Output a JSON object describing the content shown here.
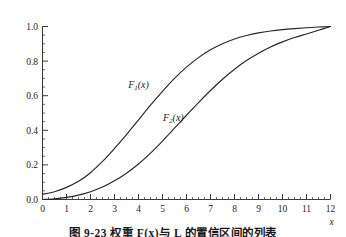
{
  "chart_data": {
    "type": "line",
    "title": "",
    "xlabel": "x",
    "ylabel": "",
    "xlim": [
      0,
      12
    ],
    "ylim": [
      0,
      1.0
    ],
    "grid": false,
    "legend_position": "inline-annotation",
    "x_ticks": [
      0,
      1,
      2,
      3,
      4,
      5,
      6,
      7,
      8,
      9,
      10,
      11,
      12
    ],
    "x_tick_labels": [
      "0",
      "1",
      "2",
      "3",
      "4",
      "5",
      "6",
      "7",
      "8",
      "9",
      "10",
      "11",
      "12"
    ],
    "x_minor_step": 0.25,
    "y_ticks": [
      0.0,
      0.2,
      0.4,
      0.6,
      0.8,
      1.0
    ],
    "y_tick_labels": [
      "0.0",
      "0.2",
      "0.4",
      "0.6",
      "0.8",
      "1.0"
    ],
    "y_minor_step": 0.05,
    "x": [
      0,
      0.5,
      1,
      1.5,
      2,
      2.5,
      3,
      3.5,
      4,
      4.5,
      5,
      5.5,
      6,
      6.5,
      7,
      7.5,
      8,
      8.5,
      9,
      9.5,
      10,
      10.5,
      11,
      11.5,
      12
    ],
    "series": [
      {
        "name": "F_1(x)",
        "label_text": "F",
        "label_sub": "1",
        "label_suffix": "(x)",
        "color": "#262626",
        "label_x": 4.0,
        "label_y": 0.645,
        "median_x": 4.3,
        "values": [
          0.03,
          0.045,
          0.07,
          0.105,
          0.155,
          0.22,
          0.295,
          0.375,
          0.46,
          0.545,
          0.625,
          0.7,
          0.765,
          0.82,
          0.865,
          0.9,
          0.928,
          0.948,
          0.963,
          0.974,
          0.982,
          0.988,
          0.993,
          0.997,
          1.0
        ]
      },
      {
        "name": "F_2(x)",
        "label_text": "F",
        "label_sub": "2",
        "label_suffix": "(x)",
        "color": "#262626",
        "label_x": 5.45,
        "label_y": 0.455,
        "median_x": 6.2,
        "values": [
          0.0,
          0.004,
          0.012,
          0.025,
          0.045,
          0.072,
          0.108,
          0.152,
          0.205,
          0.268,
          0.338,
          0.412,
          0.487,
          0.56,
          0.63,
          0.695,
          0.753,
          0.803,
          0.846,
          0.882,
          0.911,
          0.936,
          0.957,
          0.978,
          1.0
        ]
      }
    ]
  },
  "caption": {
    "text": "图 9-23  权重 F(x)与 L 的置信区间的列表"
  }
}
